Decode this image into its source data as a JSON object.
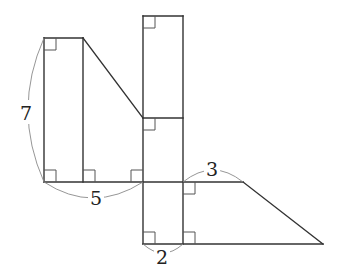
{
  "diagram": {
    "type": "geometry-figure",
    "labels": [
      {
        "id": "height_left",
        "text": "7",
        "x": 26,
        "y": 120
      },
      {
        "id": "base_left",
        "text": "5",
        "x": 96,
        "y": 205
      },
      {
        "id": "top_right",
        "text": "3",
        "x": 212,
        "y": 176
      },
      {
        "id": "width_column",
        "text": "2",
        "x": 162,
        "y": 264
      }
    ],
    "colors": {
      "line": "#333333",
      "arc": "#8a8a8a",
      "background": "#ffffff"
    }
  }
}
